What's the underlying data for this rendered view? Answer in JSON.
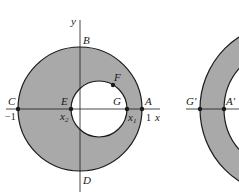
{
  "colors": {
    "fill": "#a9a9a9",
    "stroke": "#1a1a1a",
    "background": "#ffffff"
  },
  "left_figure": {
    "axes": {
      "x_label": "x",
      "y_label": "y"
    },
    "points": {
      "A": "A",
      "B": "B",
      "C": "C",
      "D": "D",
      "E": "E",
      "F": "F",
      "G": "G"
    },
    "tick_labels": {
      "neg_one": "−1",
      "one": "1"
    },
    "x1": {
      "base": "x",
      "sub": "1"
    },
    "x2": {
      "base": "x",
      "sub": "2"
    }
  },
  "right_figure": {
    "points": {
      "G_prime": "G′",
      "A_prime": "A′"
    }
  }
}
